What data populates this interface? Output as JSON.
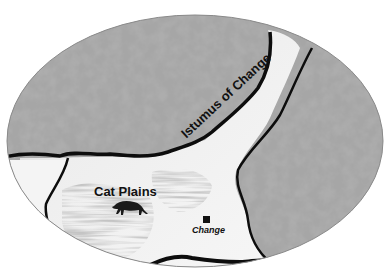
{
  "map": {
    "shape": "oval-vignette",
    "colors": {
      "terrain_dark": "#6e6e6e",
      "terrain_mid": "#9a9a9a",
      "terrain_light": "#d8d8d8",
      "lowland": "#f4f4f4",
      "coastline": "#0d0d0d",
      "grass": "#a8a8a8",
      "background": "#ffffff"
    },
    "regions": [
      {
        "id": "northern-highlands",
        "type": "mountainous-terrain"
      },
      {
        "id": "eastern-highlands",
        "type": "mountainous-terrain"
      },
      {
        "id": "cat-plains",
        "type": "grassland",
        "label": "Cat Plains"
      },
      {
        "id": "isthmus",
        "type": "lowland-corridor",
        "label": "Istumus of Change"
      }
    ],
    "labels": {
      "region": "Cat Plains",
      "isthmus": "Istumus of Change",
      "city": "Change"
    },
    "markers": [
      {
        "type": "city-square",
        "label": "Change"
      }
    ],
    "icons": [
      {
        "name": "cat-silhouette-icon",
        "location": "Cat Plains"
      }
    ]
  }
}
